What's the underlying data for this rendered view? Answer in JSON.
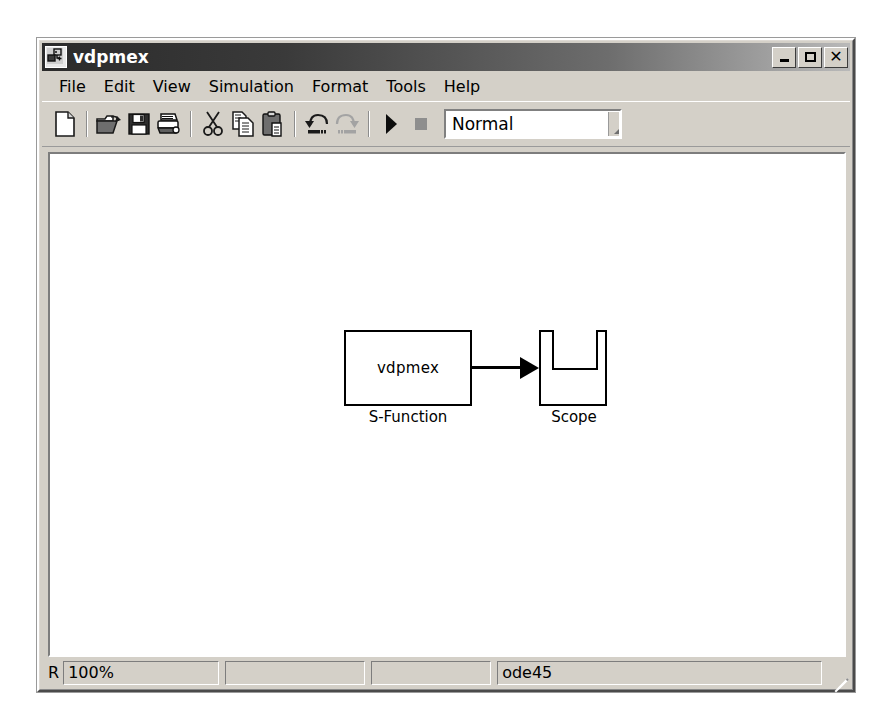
{
  "window": {
    "title": "vdpmex",
    "app_icon": "simulink-model-icon",
    "caption_buttons": [
      {
        "name": "minimize",
        "icon": "minimize-icon"
      },
      {
        "name": "maximize",
        "icon": "maximize-icon"
      },
      {
        "name": "close",
        "icon": "close-icon"
      }
    ]
  },
  "menubar": {
    "items": [
      {
        "label": "File"
      },
      {
        "label": "Edit"
      },
      {
        "label": "View"
      },
      {
        "label": "Simulation"
      },
      {
        "label": "Format"
      },
      {
        "label": "Tools"
      },
      {
        "label": "Help"
      }
    ]
  },
  "toolbar": {
    "buttons": [
      {
        "name": "new-model-button",
        "icon": "new-document-icon",
        "enabled": true
      },
      {
        "name": "open-model-button",
        "icon": "open-folder-icon",
        "enabled": true
      },
      {
        "name": "save-model-button",
        "icon": "floppy-save-icon",
        "enabled": true
      },
      {
        "name": "print-button",
        "icon": "printer-icon",
        "enabled": true
      },
      {
        "name": "cut-button",
        "icon": "scissors-icon",
        "enabled": true
      },
      {
        "name": "copy-button",
        "icon": "copy-pages-icon",
        "enabled": true
      },
      {
        "name": "paste-button",
        "icon": "clipboard-paste-icon",
        "enabled": true
      },
      {
        "name": "undo-button",
        "icon": "undo-arrow-icon",
        "enabled": true
      },
      {
        "name": "redo-button",
        "icon": "redo-arrow-icon",
        "enabled": false
      },
      {
        "name": "start-simulation-button",
        "icon": "play-triangle-icon",
        "enabled": true
      },
      {
        "name": "stop-simulation-button",
        "icon": "stop-square-icon",
        "enabled": false
      }
    ],
    "simulation_mode": {
      "value": "Normal",
      "options": [
        "Normal",
        "Accelerator",
        "External"
      ]
    }
  },
  "canvas": {
    "blocks": [
      {
        "name": "s-function-block",
        "inner_text": "vdpmex",
        "label": "S-Function"
      },
      {
        "name": "scope-block",
        "inner_text": "",
        "label": "Scope"
      }
    ],
    "connection": {
      "name": "signal-line",
      "from": "s-function-block",
      "to": "scope-block"
    }
  },
  "statusbar": {
    "mode_letter": "R",
    "zoom": "100%",
    "pane2": "",
    "pane3": "",
    "solver": "ode45",
    "grip": "resize-grip-icon"
  },
  "colors": {
    "window_face": "#d4d0c8",
    "canvas": "#ffffff",
    "title_start": "#2b2b2b",
    "title_end": "#b9b9b9",
    "block_stroke": "#000000"
  }
}
